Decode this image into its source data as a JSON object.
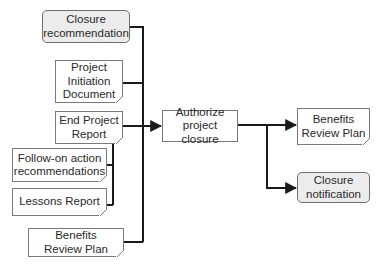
{
  "diagram": {
    "type": "process-flow",
    "colors": {
      "line": "#1a1a1a",
      "box_border": "#7a7a7a",
      "rounded_fill": "#ececec",
      "text": "#2a2a2a"
    },
    "inputs": [
      {
        "id": "closure_recommendation",
        "label": "Closure\nrecommendation",
        "shape": "rounded"
      },
      {
        "id": "project_initiation_document",
        "label": "Project\nInitiation\nDocument",
        "shape": "document"
      },
      {
        "id": "end_project_report",
        "label": "End Project\nReport",
        "shape": "document"
      },
      {
        "id": "follow_on_action_recommendations",
        "label": "Follow-on action\nrecommendations",
        "shape": "document"
      },
      {
        "id": "lessons_report",
        "label": "Lessons Report",
        "shape": "document"
      },
      {
        "id": "benefits_review_plan_in",
        "label": "Benefits\nReview Plan",
        "shape": "document"
      }
    ],
    "activity": {
      "id": "authorize_project_closure",
      "label": "Authorize\nproject closure",
      "shape": "process"
    },
    "outputs": [
      {
        "id": "benefits_review_plan_out",
        "label": "Benefits\nReview Plan",
        "shape": "document"
      },
      {
        "id": "closure_notification",
        "label": "Closure\nnotification",
        "shape": "rounded"
      }
    ],
    "edges": [
      {
        "from": "closure_recommendation",
        "to": "authorize_project_closure"
      },
      {
        "from": "project_initiation_document",
        "to": "authorize_project_closure"
      },
      {
        "from": "end_project_report",
        "to": "authorize_project_closure"
      },
      {
        "from": "follow_on_action_recommendations",
        "to": "end_project_report"
      },
      {
        "from": "lessons_report",
        "to": "end_project_report"
      },
      {
        "from": "benefits_review_plan_in",
        "to": "authorize_project_closure"
      },
      {
        "from": "authorize_project_closure",
        "to": "benefits_review_plan_out"
      },
      {
        "from": "authorize_project_closure",
        "to": "closure_notification"
      }
    ]
  }
}
